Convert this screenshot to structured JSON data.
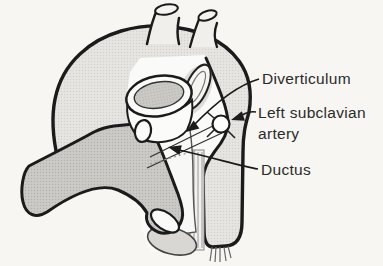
{
  "figure": {
    "type": "anatomical-line-diagram",
    "labels": {
      "diverticulum": "Diverticulum",
      "left_subclavian_1": "Left subclavian",
      "left_subclavian_2": "artery",
      "ductus": "Ductus"
    },
    "colors": {
      "background": "#f7f6f2",
      "outline": "#1b1b1b",
      "aorta_fill": "#e6e5e2",
      "aorta_dot": "#d2d1ce",
      "pulmonary_fill": "#cbcac7",
      "pulmonary_dot": "#b3b2af",
      "cut_face": "#d8d7d4",
      "white_structure": "#fafaf8",
      "label_text": "#2b2b2b"
    }
  }
}
